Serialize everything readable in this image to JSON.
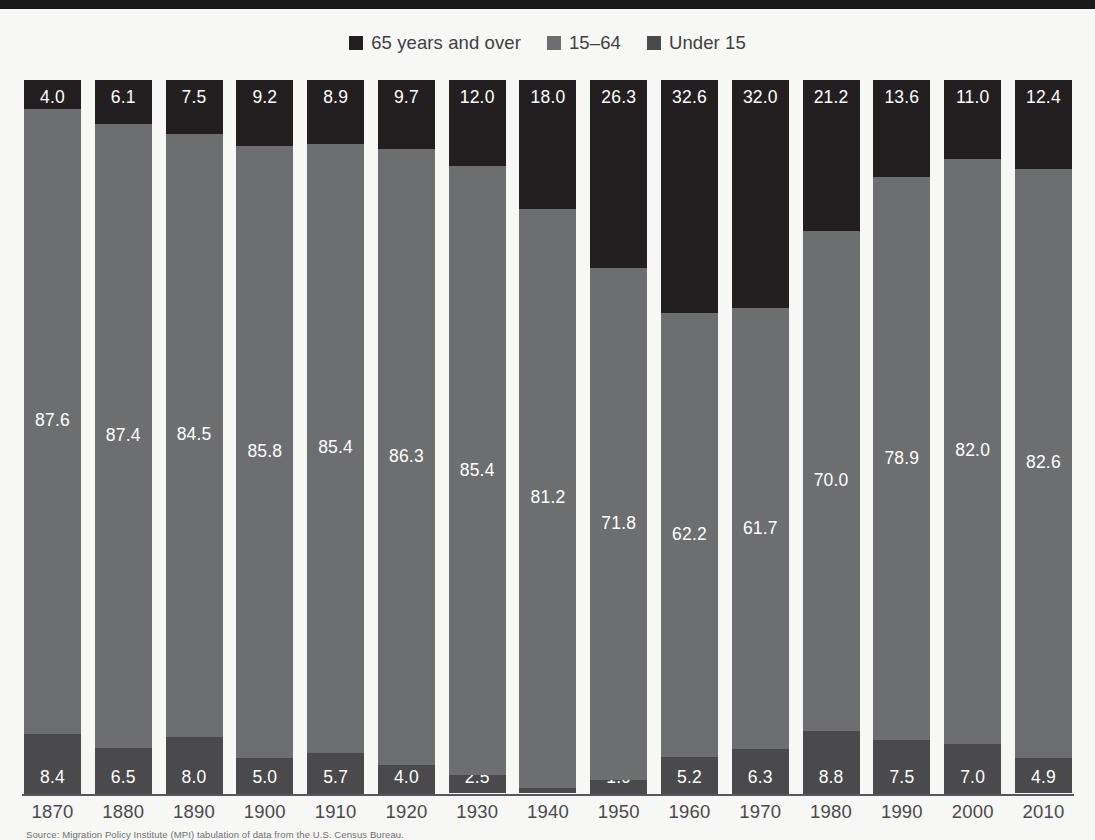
{
  "colors": {
    "top_rule": "#1a1a1a",
    "background": "#f7f7f5",
    "over65": "#231f20",
    "age15to64": "#6d6e70",
    "under15": "#4a4a4c",
    "axis": "#58585a",
    "label_text": "#4a4a4c",
    "value_text": "#ffffff"
  },
  "legend": {
    "items": [
      {
        "label": "65 years and over",
        "swatch_icon": "square-swatch-icon",
        "color": "#231f20"
      },
      {
        "label": "15–64",
        "swatch_icon": "square-swatch-icon",
        "color": "#6d6e70"
      },
      {
        "label": "Under 15",
        "swatch_icon": "square-swatch-icon",
        "color": "#4a4a4c"
      }
    ]
  },
  "source_note": "Source: Migration Policy Institute (MPI) tabulation of data from the U.S. Census Bureau.",
  "chart_data": {
    "type": "bar",
    "subtype": "stacked-100-percent",
    "title": "",
    "subtitle": "",
    "xlabel": "",
    "ylabel": "",
    "ylim": [
      0,
      100
    ],
    "grid": false,
    "legend_position": "top-center",
    "categories": [
      "1870",
      "1880",
      "1890",
      "1900",
      "1910",
      "1920",
      "1930",
      "1940",
      "1950",
      "1960",
      "1970",
      "1980",
      "1990",
      "2000",
      "2010"
    ],
    "series": [
      {
        "name": "65 years and over",
        "color": "#231f20",
        "values": [
          4.0,
          6.1,
          7.5,
          9.2,
          8.9,
          9.7,
          12.0,
          18.0,
          26.3,
          32.6,
          32.0,
          21.2,
          13.6,
          11.0,
          12.4
        ]
      },
      {
        "name": "15–64",
        "color": "#6d6e70",
        "values": [
          87.6,
          87.4,
          84.5,
          85.8,
          85.4,
          86.3,
          85.4,
          81.2,
          71.8,
          62.2,
          61.7,
          70.0,
          78.9,
          82.0,
          82.6
        ]
      },
      {
        "name": "Under 15",
        "color": "#4a4a4c",
        "values": [
          8.4,
          6.5,
          8.0,
          5.0,
          5.7,
          4.0,
          2.5,
          0.7,
          1.9,
          5.2,
          6.3,
          8.8,
          7.5,
          7.0,
          4.9
        ]
      }
    ]
  }
}
